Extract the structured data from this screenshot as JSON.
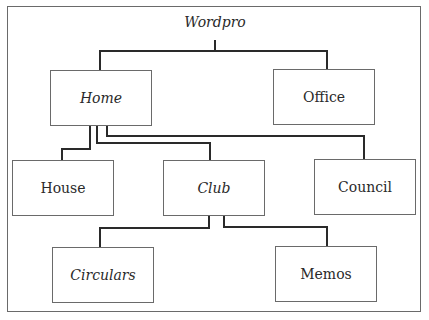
{
  "diagram": {
    "title": "Wordpro",
    "root": {
      "label": "Wordpro",
      "italic": true
    },
    "nodes": {
      "home": {
        "label": "Home",
        "italic": true,
        "parent": "Wordpro"
      },
      "office": {
        "label": "Office",
        "italic": false,
        "parent": "Wordpro"
      },
      "house": {
        "label": "House",
        "italic": false,
        "parent": "Home"
      },
      "club": {
        "label": "Club",
        "italic": true,
        "parent": "Home"
      },
      "council": {
        "label": "Council",
        "italic": false,
        "parent": "Home"
      },
      "circulars": {
        "label": "Circulars",
        "italic": true,
        "parent": "Club"
      },
      "memos": {
        "label": "Memos",
        "italic": false,
        "parent": "Club"
      }
    },
    "colors": {
      "line": "#2a2a2a",
      "border": "#6a6a6a",
      "background": "#ffffff",
      "text": "#2a2a2a"
    }
  }
}
